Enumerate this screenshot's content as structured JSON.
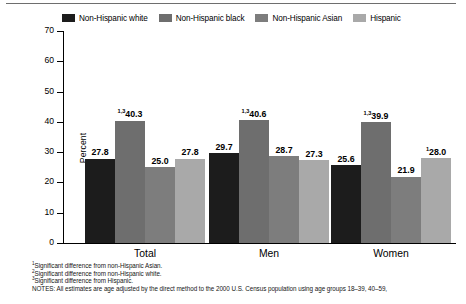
{
  "chart_data": {
    "type": "bar",
    "title": "",
    "xlabel": "",
    "ylabel": "Percent",
    "ylim": [
      0,
      70
    ],
    "ytick_values": [
      70,
      60,
      50,
      40,
      30,
      20,
      10,
      0
    ],
    "ytick_labels": [
      "70",
      "60",
      "50",
      "40",
      "30",
      "20",
      "10",
      "0"
    ],
    "grid": false,
    "legend_position": "top",
    "categories": [
      "Total",
      "Men",
      "Women"
    ],
    "series": [
      {
        "name": "Non-Hispanic white",
        "color": "#1c1c1c",
        "values": [
          27.8,
          29.7,
          25.6
        ],
        "labels": [
          "27.8",
          "29.7",
          "25.6"
        ],
        "superscripts": [
          "",
          "",
          ""
        ]
      },
      {
        "name": "Non-Hispanic black",
        "color": "#6e6e6e",
        "values": [
          40.3,
          40.6,
          39.9
        ],
        "labels": [
          "40.3",
          "40.6",
          "39.9"
        ],
        "superscripts": [
          "1,3",
          "1,3",
          "1,3"
        ]
      },
      {
        "name": "Non-Hispanic Asian",
        "color": "#7d7d7d",
        "values": [
          25.0,
          28.7,
          21.9
        ],
        "labels": [
          "25.0",
          "28.7",
          "21.9"
        ],
        "superscripts": [
          "",
          "",
          ""
        ]
      },
      {
        "name": "Hispanic",
        "color": "#a9a9a9",
        "values": [
          27.8,
          27.3,
          28.0
        ],
        "labels": [
          "27.8",
          "27.3",
          "28.0"
        ],
        "superscripts": [
          "",
          "",
          "1"
        ]
      }
    ]
  },
  "legend": {
    "items": [
      {
        "label": "Non-Hispanic white",
        "color": "#1c1c1c"
      },
      {
        "label": "Non-Hispanic black",
        "color": "#6e6e6e"
      },
      {
        "label": "Non-Hispanic Asian",
        "color": "#7d7d7d"
      },
      {
        "label": "Hispanic",
        "color": "#a9a9a9"
      }
    ]
  },
  "footnotes": [
    {
      "marker": "1",
      "text": "Significant difference from non-Hispanic Asian."
    },
    {
      "marker": "2",
      "text": "Significant difference from non-Hispanic white."
    },
    {
      "marker": "3",
      "text": "Significant difference from Hispanic."
    }
  ],
  "notes": "NOTES: All estimates are age adjusted by the direct method to the 2000 U.S. Census population using age groups 18–39, 40–59,"
}
